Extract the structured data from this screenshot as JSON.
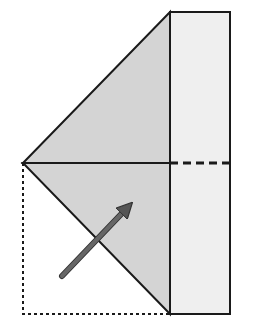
{
  "diagram": {
    "colors": {
      "flap_fill": "#d4d4d4",
      "strip_fill": "#efefef",
      "stroke": "#1a1a1a",
      "arrow": "#555555",
      "background": "#ffffff"
    },
    "shapes": {
      "strip": {
        "x": 170,
        "y": 12,
        "width": 60,
        "height": 302
      },
      "upper_triangle": "23,163 170,12 170,163",
      "lower_triangle": "23,163 170,163 170,314",
      "dotted_square": {
        "x": 23,
        "y": 163,
        "width": 147,
        "height": 151
      },
      "dashed_line": {
        "x1": 170,
        "y1": 163,
        "x2": 230,
        "y2": 163
      },
      "arrow": {
        "x1": 62,
        "y1": 276,
        "x2": 133,
        "y2": 202
      }
    }
  }
}
